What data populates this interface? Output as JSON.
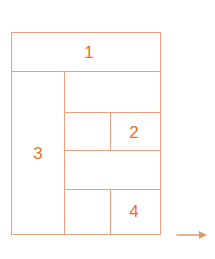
{
  "diagram": {
    "outline_color": "#e9a17c",
    "label_color": "#e8702a",
    "background_color": "#ffffff",
    "frame": {
      "x": 11,
      "y": 32,
      "width": 150,
      "height": 203
    },
    "regions": [
      {
        "id": "1",
        "label": "1",
        "x": 11,
        "y": 32,
        "width": 150,
        "height": 39,
        "labeled": true
      },
      {
        "id": "3",
        "label": "3",
        "x": 11,
        "y": 71,
        "width": 53,
        "height": 164,
        "labeled": true
      },
      {
        "id": "r1",
        "label": "",
        "x": 64,
        "y": 71,
        "width": 97,
        "height": 41,
        "labeled": false
      },
      {
        "id": "r2a",
        "label": "",
        "x": 64,
        "y": 112,
        "width": 46,
        "height": 38,
        "labeled": false
      },
      {
        "id": "2",
        "label": "2",
        "x": 110,
        "y": 112,
        "width": 51,
        "height": 38,
        "labeled": true
      },
      {
        "id": "r3",
        "label": "",
        "x": 64,
        "y": 150,
        "width": 97,
        "height": 39,
        "labeled": false
      },
      {
        "id": "r4a",
        "label": "",
        "x": 64,
        "y": 189,
        "width": 46,
        "height": 46,
        "labeled": false
      },
      {
        "id": "4",
        "label": "4",
        "x": 110,
        "y": 189,
        "width": 51,
        "height": 46,
        "labeled": true
      }
    ],
    "labels": [
      {
        "text": "1",
        "cx": 89,
        "cy": 52
      },
      {
        "text": "3",
        "cx": 38,
        "cy": 153
      },
      {
        "text": "2",
        "cx": 134,
        "cy": 132
      },
      {
        "text": "4",
        "cx": 134,
        "cy": 211
      }
    ],
    "dividers": {
      "horizontal": [
        {
          "x": 11,
          "y": 71,
          "length": 150
        },
        {
          "x": 64,
          "y": 112,
          "length": 97
        },
        {
          "x": 64,
          "y": 150,
          "length": 97
        },
        {
          "x": 64,
          "y": 189,
          "length": 97
        }
      ],
      "vertical": [
        {
          "x": 64,
          "y": 71,
          "length": 164
        },
        {
          "x": 110,
          "y": 112,
          "length": 38
        },
        {
          "x": 110,
          "y": 189,
          "length": 46
        }
      ]
    },
    "arrow": {
      "name": "direction-arrow",
      "direction": "right",
      "color": "#e09a72",
      "x": 176,
      "y": 228,
      "length": 32
    }
  }
}
